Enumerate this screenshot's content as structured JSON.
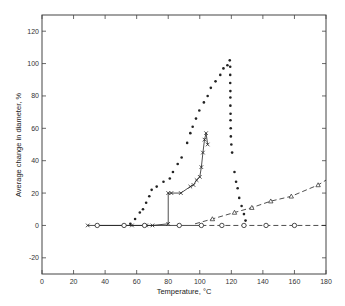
{
  "chart_data": {
    "type": "line",
    "title": "",
    "xlabel": "Temperature, °C",
    "ylabel": "Average change in diameter, %",
    "xlim": [
      0,
      180
    ],
    "ylim": [
      -30,
      130
    ],
    "xticks": [
      0,
      20,
      40,
      60,
      80,
      100,
      120,
      140,
      160,
      180
    ],
    "yticks": [
      -20,
      0,
      20,
      40,
      60,
      80,
      100,
      120
    ],
    "grid": false,
    "legend": null,
    "series": [
      {
        "name": "dots",
        "marker": "filled-circle",
        "line": "none",
        "x": [
          56,
          59,
          62,
          64,
          66,
          68,
          69.5,
          72.7,
          77,
          81,
          83,
          86,
          88.5,
          92,
          94,
          95.5,
          97.6,
          99.7,
          102.6,
          105,
          107,
          110,
          113,
          115,
          117.5,
          119,
          119.3,
          119.3,
          119.3,
          119.4,
          119.4,
          119.4,
          119.5,
          119.5,
          119.6,
          119.7,
          120,
          120.5,
          122,
          123,
          124,
          125,
          126.5,
          128,
          129
        ],
        "y": [
          1,
          4,
          8,
          10,
          14,
          18,
          22,
          24,
          27,
          29,
          33,
          38,
          42,
          51,
          57,
          61,
          66,
          71,
          76,
          80,
          85,
          89,
          93,
          97,
          99,
          102,
          98,
          93,
          88,
          83,
          79,
          74,
          69,
          65,
          60,
          55,
          50,
          45,
          33,
          27,
          23,
          17,
          12,
          7,
          3
        ]
      },
      {
        "name": "crosses",
        "marker": "x",
        "line": "solid",
        "x": [
          29,
          57,
          66,
          70,
          80,
          80,
          82,
          88,
          94,
          96,
          98,
          100,
          101,
          102,
          103,
          104,
          105
        ],
        "y": [
          0,
          0,
          0,
          0,
          1,
          20,
          20,
          20,
          24,
          25,
          28,
          30,
          36,
          45,
          53,
          57,
          50
        ]
      },
      {
        "name": "circles",
        "marker": "open-circle",
        "line": "solid-then-dashed",
        "x": [
          35,
          52,
          65,
          87,
          101,
          114,
          128,
          142,
          160,
          180
        ],
        "y": [
          0,
          0,
          0,
          0,
          0,
          0,
          0,
          0,
          0,
          0
        ]
      },
      {
        "name": "triangles",
        "marker": "open-triangle",
        "line": "dashed",
        "x": [
          97,
          108,
          122,
          133,
          145,
          158,
          175,
          180
        ],
        "y": [
          1,
          4,
          8,
          11,
          15,
          18,
          25,
          28
        ]
      }
    ]
  }
}
